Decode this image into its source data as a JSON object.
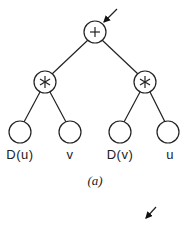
{
  "figure": {
    "caption": "(a)",
    "nodes": [
      {
        "id": "root",
        "symbol": "+",
        "type": "operator"
      },
      {
        "id": "left-mul",
        "symbol": "∗",
        "type": "operator"
      },
      {
        "id": "right-mul",
        "symbol": "∗",
        "type": "operator"
      },
      {
        "id": "leaf-1",
        "label": "D(u)",
        "type": "leaf"
      },
      {
        "id": "leaf-2",
        "label": "v",
        "type": "leaf"
      },
      {
        "id": "leaf-3",
        "label": "D(v)",
        "type": "leaf"
      },
      {
        "id": "leaf-4",
        "label": "u",
        "type": "leaf"
      }
    ],
    "edges": [
      [
        "root",
        "left-mul"
      ],
      [
        "root",
        "right-mul"
      ],
      [
        "left-mul",
        "leaf-1"
      ],
      [
        "left-mul",
        "leaf-2"
      ],
      [
        "right-mul",
        "leaf-3"
      ],
      [
        "right-mul",
        "leaf-4"
      ]
    ],
    "arrows": [
      "pointer-arrow-to-root",
      "pointer-arrow-bottom"
    ]
  }
}
